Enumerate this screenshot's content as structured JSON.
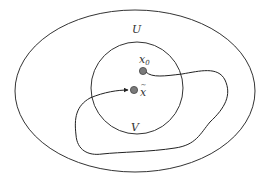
{
  "diagram": {
    "type": "set-path-diagram",
    "sets": [
      {
        "id": "U",
        "label": "U",
        "shape": "ellipse",
        "description": "outer open set"
      },
      {
        "id": "V",
        "label": "V",
        "shape": "circle",
        "description": "inner neighborhood inside U"
      }
    ],
    "points": [
      {
        "id": "x0",
        "label": "x",
        "subscript": "0",
        "fill": "#7a7a7a"
      },
      {
        "id": "xtilde",
        "label": "x",
        "accent": "~",
        "fill": "#7a7a7a"
      }
    ],
    "path": {
      "from": "x0",
      "to": "xtilde",
      "description": "curve leaving V from x0, looping inside U, re-entering V with an arrow at x̃"
    },
    "colors": {
      "stroke": "#333333",
      "point_fill": "#7a7a7a",
      "background": "#ffffff"
    }
  }
}
